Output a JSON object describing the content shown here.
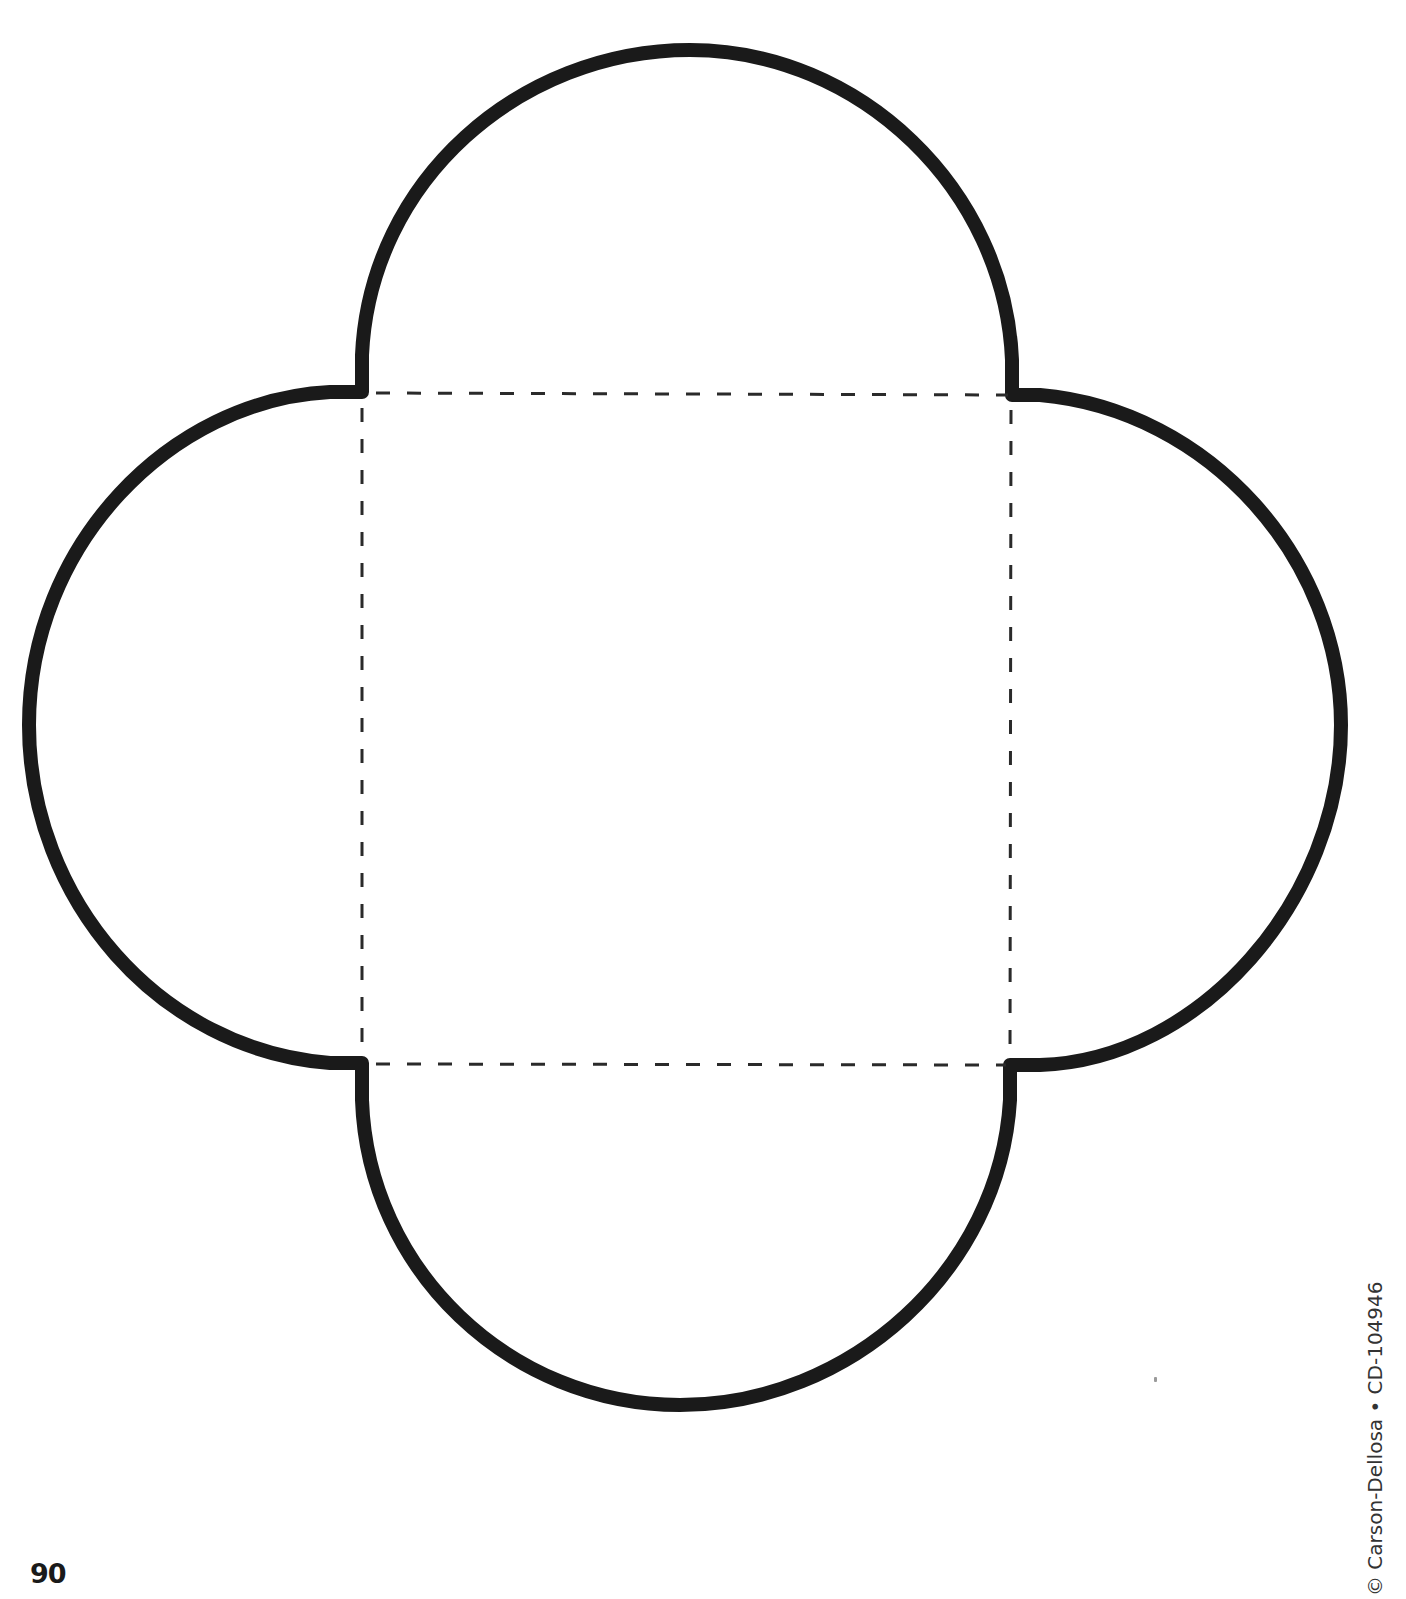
{
  "page": {
    "page_number": "90",
    "copyright": "© Carson-Dellosa • CD-104946"
  },
  "template": {
    "shape": "envelope-template",
    "outline": {
      "stroke_color": "#1a1a1a",
      "stroke_width": 14
    },
    "fold_lines": {
      "style": "dashed",
      "stroke_color": "#2a2a2a",
      "stroke_width": 3,
      "square": {
        "top_left": [
          362,
          392
        ],
        "top_right": [
          1012,
          395
        ],
        "bottom_right": [
          1010,
          1065
        ],
        "bottom_left": [
          362,
          1063
        ]
      }
    },
    "flaps": [
      "top",
      "right",
      "bottom",
      "left"
    ]
  }
}
